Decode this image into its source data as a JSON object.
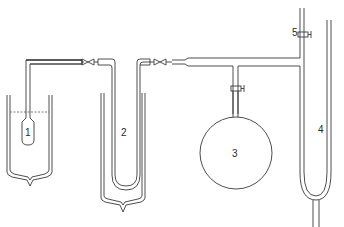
{
  "diagram": {
    "type": "laboratory apparatus schematic",
    "components": [
      {
        "id": "1",
        "label": "1",
        "description": "sample tube immersed in cooling bath (Dewar)"
      },
      {
        "id": "2",
        "label": "2",
        "description": "U-tube trap immersed in cooling bath (Dewar)"
      },
      {
        "id": "3",
        "label": "3",
        "description": "spherical storage bulb with stopcock"
      },
      {
        "id": "4",
        "label": "4",
        "description": "U-tube manometer"
      },
      {
        "id": "5",
        "label": "5",
        "description": "stopcock on vertical line above manometer"
      }
    ],
    "colors": {
      "line": "#3a3a3a",
      "background": "#ffffff"
    }
  }
}
